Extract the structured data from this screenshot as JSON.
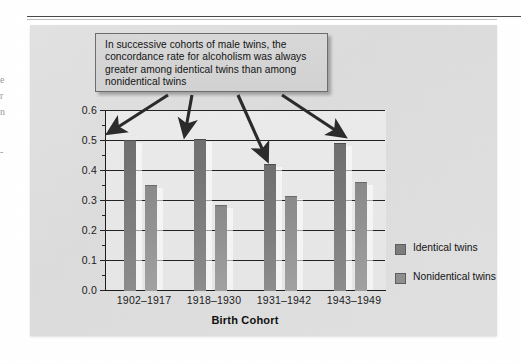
{
  "figure": {
    "panel_background": "#dedede",
    "callout": {
      "text": "In successive cohorts of male twins, the concordance rate for alcoholism was always greater among identical twins than among nonidentical twins",
      "fill": "#d5d5d5",
      "border": "#6d6d6d"
    },
    "margin_fragments": [
      "e",
      "r",
      "n",
      "-"
    ]
  },
  "chart_data": {
    "type": "bar",
    "title": "",
    "xlabel": "Birth Cohort",
    "ylabel": "Concordance Rate",
    "categories": [
      "1902–1917",
      "1918–1930",
      "1931–1942",
      "1943–1949"
    ],
    "series": [
      {
        "name": "Identical twins",
        "values": [
          0.5,
          0.505,
          0.42,
          0.49
        ],
        "color": "#7b7b7b"
      },
      {
        "name": "Nonidentical twins",
        "values": [
          0.35,
          0.285,
          0.315,
          0.36
        ],
        "color": "#949494"
      }
    ],
    "ylim": [
      0.0,
      0.6
    ],
    "ytick_labels": [
      "0.6",
      "0.5",
      "0.4",
      "0.3",
      "0.2",
      "0.1",
      "0.0"
    ],
    "ytick_values": [
      0.6,
      0.5,
      0.4,
      0.3,
      0.2,
      0.1,
      0.0
    ],
    "ystep": 0.1,
    "grid": true,
    "legend_position": "right",
    "annotations": [
      {
        "text": "In successive cohorts of male twins, the concordance rate for alcoholism was always greater among identical twins than among nonidentical twins",
        "points_to": [
          "1902–1917",
          "1918–1930",
          "1931–1942",
          "1943–1949"
        ]
      }
    ]
  }
}
